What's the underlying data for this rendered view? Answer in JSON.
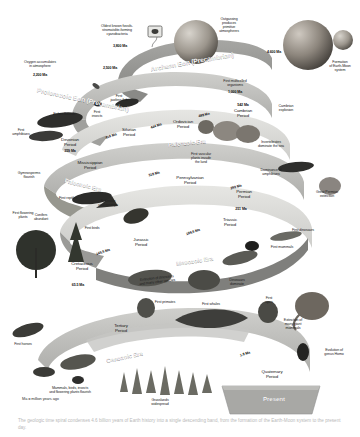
{
  "figure": {
    "title": "Geologic time spiral",
    "key_note": "Ma = million years ago",
    "present_label": "Present",
    "caption": "The geologic time spiral condenses 4.6 billion years of Earth history into a single descending band, from the formation of the Earth-Moon system to the present day."
  },
  "colors": {
    "band_top": "#9a9a98",
    "band_face": "#b9b9b6",
    "band_light": "#d8d8d5",
    "band_shadow": "#7e7e7c",
    "background": "#ffffff",
    "text_dark": "#1a1a1a",
    "text_light": "#ffffff",
    "caption_gray": "#b9b9b9"
  },
  "eons": [
    {
      "name": "Archean Eon (Precambrian)"
    },
    {
      "name": "Proterozoic Eon (Precambrian)"
    }
  ],
  "eras": [
    {
      "name": "Paleozoic Era"
    },
    {
      "name": "Paleozoic Era"
    },
    {
      "name": "Mesozoic Era"
    },
    {
      "name": "Cenozoic Era"
    }
  ],
  "periods": [
    {
      "name": "Cambrian\nPeriod",
      "age": "542 Ma"
    },
    {
      "name": "Ordovician\nPeriod",
      "age": "488 Ma"
    },
    {
      "name": "Silurian\nPeriod",
      "age": "444 Ma"
    },
    {
      "name": "Devonian\nPeriod",
      "age": "416 Ma"
    },
    {
      "name": "Mississippian\nPeriod",
      "age": "359 Ma"
    },
    {
      "name": "Pennsylvanian\nPeriod",
      "age": "318 Ma"
    },
    {
      "name": "Permian\nPeriod",
      "age": "299 Ma"
    },
    {
      "name": "Triassic\nPeriod",
      "age": "251 Ma"
    },
    {
      "name": "Jurassic\nPeriod",
      "age": "199.6 Ma"
    },
    {
      "name": "Cretaceous\nPeriod",
      "age": "145.5 Ma"
    },
    {
      "name": "Tertiary\nPeriod",
      "age": "65.5 Ma"
    },
    {
      "name": "Quaternary\nPeriod",
      "age": "1.8 Ma"
    }
  ],
  "age_markers": [
    {
      "value": "4,600 Ma"
    },
    {
      "value": "3,800 Ma"
    },
    {
      "value": "2,500 Ma"
    },
    {
      "value": "2,200 Ma"
    },
    {
      "value": "1,000 Ma"
    }
  ],
  "events": [
    {
      "text": "Oldest known fossils-\nstromatolite-forming\ncyanobacteria"
    },
    {
      "text": "Outgassing\nproduces\nprimitive\natmospheres"
    },
    {
      "text": "Formation\nof Earth-Moon\nsystem"
    },
    {
      "text": "Oxygen accumulates\nin atmosphere"
    },
    {
      "text": "First multicelled\norganisms"
    },
    {
      "text": "Cambrian\nexplosion"
    },
    {
      "text": "Invertebrates\ndominate the sea"
    },
    {
      "text": "First vascular\nplants invade\nthe land"
    },
    {
      "text": "First\njawless fish"
    },
    {
      "text": "Fishes flourish"
    },
    {
      "text": "First\ninsects"
    },
    {
      "text": "First\namphibians"
    },
    {
      "text": "Gymnosperms\nflourish"
    },
    {
      "text": "Extensive\ncoal swamps"
    },
    {
      "text": "Dominance of\namphibians"
    },
    {
      "text": "Great Permian\nextinction"
    },
    {
      "text": "First dinosaurs"
    },
    {
      "text": "First mammals"
    },
    {
      "text": "First reptiles"
    },
    {
      "text": "Conifers\nabundant"
    },
    {
      "text": "First birds"
    },
    {
      "text": "Dinosaurs\ndominate"
    },
    {
      "text": "First flowering\nplants"
    },
    {
      "text": "Extinction of dinosaurs\nand many other species"
    },
    {
      "text": "First primates"
    },
    {
      "text": "First whales"
    },
    {
      "text": "First\napes"
    },
    {
      "text": "Extinction of\nmany giant\nmammals"
    },
    {
      "text": "Evolution of\ngenus Homo"
    },
    {
      "text": "First horses"
    },
    {
      "text": "Mammals, birds, insects\nand flowering plants flourish"
    },
    {
      "text": "Grasslands\nwidespread"
    }
  ]
}
